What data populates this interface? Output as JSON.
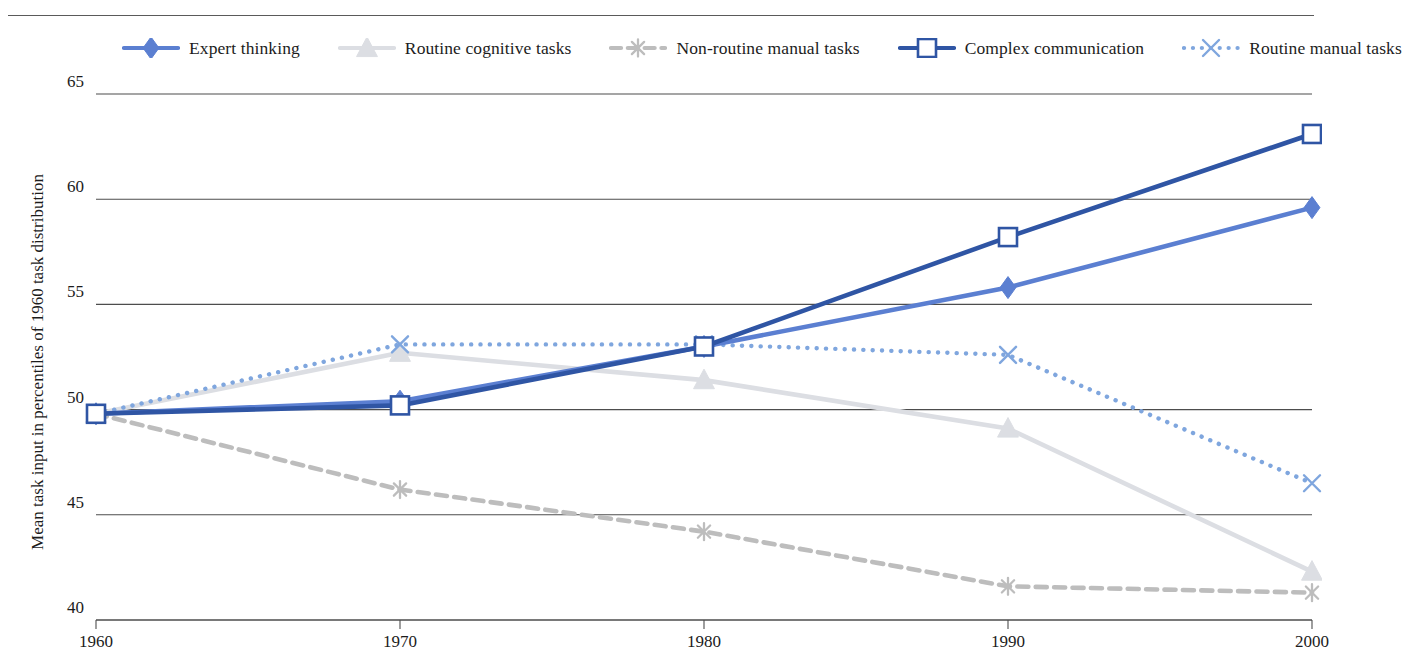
{
  "chart_data": {
    "type": "line",
    "title": "",
    "xlabel": "",
    "ylabel": "Mean task input in percentiles of 1960 task distribution",
    "x": [
      1960,
      1970,
      1980,
      1990,
      2000
    ],
    "xticklabels": [
      "1960",
      "1970",
      "1980",
      "1990",
      "2000"
    ],
    "yticklabels": [
      "40",
      "45",
      "50",
      "55",
      "60",
      "65"
    ],
    "yticks": [
      40,
      45,
      50,
      55,
      60,
      65
    ],
    "ylim": [
      40,
      65
    ],
    "xlim": [
      1960,
      2000
    ],
    "grid": "horizontal",
    "legend_position": "top",
    "series": [
      {
        "name": "Expert thinking",
        "color": "#5B7FD1",
        "marker": "diamond",
        "linestyle": "solid",
        "values": [
          49.8,
          50.4,
          53.0,
          55.8,
          59.6
        ]
      },
      {
        "name": "Routine cognitive tasks",
        "color": "#DCDEE3",
        "marker": "triangle",
        "linestyle": "solid",
        "values": [
          49.8,
          52.7,
          51.4,
          49.1,
          42.3
        ]
      },
      {
        "name": "Non-routine manual tasks",
        "color": "#BDBDBD",
        "marker": "asterisk",
        "linestyle": "dashed",
        "values": [
          49.8,
          46.2,
          44.2,
          41.6,
          41.3
        ]
      },
      {
        "name": "Complex communication",
        "color": "#2F55A4",
        "marker": "square-open",
        "linestyle": "solid",
        "values": [
          49.8,
          50.2,
          53.0,
          58.2,
          63.1
        ]
      },
      {
        "name": "Routine manual tasks",
        "color": "#7FA6DE",
        "marker": "x",
        "linestyle": "dotted",
        "values": [
          49.8,
          53.1,
          53.1,
          52.6,
          46.5
        ]
      }
    ]
  }
}
